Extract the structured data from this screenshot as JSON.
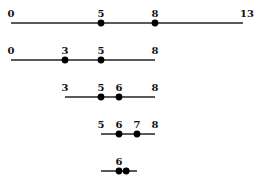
{
  "diagram": {
    "scale": {
      "origin_px": 11,
      "px_per_unit": 18
    },
    "rows": [
      {
        "y": 23,
        "start": 0,
        "end": 13,
        "labels": [
          "0",
          "5",
          "8",
          "13"
        ],
        "label_values": [
          0,
          5,
          8,
          13
        ],
        "dots": [
          5,
          8
        ]
      },
      {
        "y": 60,
        "start": 0,
        "end": 8,
        "labels": [
          "0",
          "3",
          "5",
          "8"
        ],
        "label_values": [
          0,
          3,
          5,
          8
        ],
        "dots": [
          3,
          5
        ]
      },
      {
        "y": 97,
        "start": 3,
        "end": 8,
        "labels": [
          "3",
          "5",
          "6",
          "8"
        ],
        "label_values": [
          3,
          5,
          6,
          8
        ],
        "dots": [
          5,
          6
        ]
      },
      {
        "y": 134,
        "start": 5,
        "end": 8,
        "labels": [
          "5",
          "6",
          "7",
          "8"
        ],
        "label_values": [
          5,
          6,
          7,
          8
        ],
        "dots": [
          6,
          7
        ]
      },
      {
        "y": 171,
        "start": 5,
        "end": 7,
        "labels": [
          "6"
        ],
        "label_values": [
          6
        ],
        "dots": [
          6,
          6.4
        ]
      }
    ]
  }
}
